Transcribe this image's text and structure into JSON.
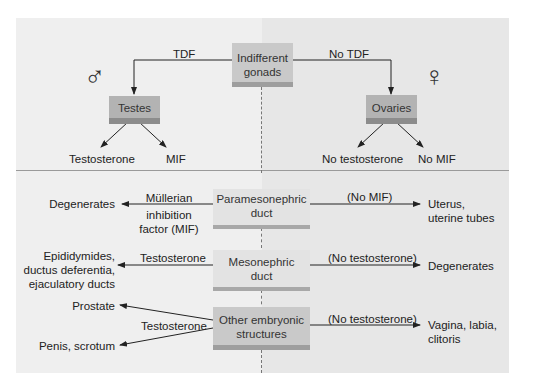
{
  "top_section": {
    "root": {
      "line1": "Indifferent",
      "line2": "gonads"
    },
    "left_branch_label": "TDF",
    "right_branch_label": "No TDF",
    "male_symbol": "♂",
    "female_symbol": "♀",
    "male_gonad": "Testes",
    "female_gonad": "Ovaries",
    "male_outputs": [
      "Testosterone",
      "MIF"
    ],
    "female_outputs": [
      "No testosterone",
      "No MIF"
    ]
  },
  "bottom_section": {
    "rows": [
      {
        "structure": {
          "line1": "Paramesonephric",
          "line2": "duct"
        },
        "left_condition": [
          "Müllerian",
          "inhibition",
          "factor (MIF)"
        ],
        "left_result": [
          "Degenerates"
        ],
        "right_condition": "(No MIF)",
        "right_result": [
          "Uterus,",
          "uterine tubes"
        ]
      },
      {
        "structure": {
          "line1": "Mesonephric",
          "line2": "duct"
        },
        "left_condition": [
          "Testosterone"
        ],
        "left_result": [
          "Epididymides,",
          "ductus deferentia,",
          "ejaculatory ducts"
        ],
        "right_condition": "(No testosterone)",
        "right_result": [
          "Degenerates"
        ]
      },
      {
        "structure": {
          "line1": "Other embryonic",
          "line2": "structures"
        },
        "left_condition": [
          "Testosterone"
        ],
        "left_result": [
          "Prostate",
          "Penis, scrotum"
        ],
        "right_condition": "(No testosterone)",
        "right_result": [
          "Vagina, labia,",
          "clitoris"
        ]
      }
    ]
  },
  "colors": {
    "panel_left": "#efefef",
    "panel_right": "#e7e7e7",
    "box_dark": "#b3b3b3",
    "box_mid": "#c9c9c9",
    "box_light": "#e3e3e3",
    "arrow": "#222222"
  }
}
